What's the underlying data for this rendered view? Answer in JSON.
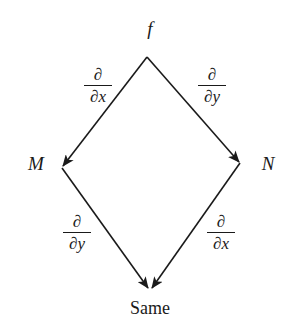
{
  "diagram": {
    "type": "commutative-diagram",
    "nodes": {
      "top": {
        "label": "f"
      },
      "left": {
        "label": "M"
      },
      "right": {
        "label": "N"
      },
      "bottom": {
        "label": "Same"
      }
    },
    "edges": [
      {
        "from": "f",
        "to": "M",
        "numerator": "∂",
        "denominator": "∂x"
      },
      {
        "from": "f",
        "to": "N",
        "numerator": "∂",
        "denominator": "∂y"
      },
      {
        "from": "M",
        "to": "Same",
        "numerator": "∂",
        "denominator": "∂y"
      },
      {
        "from": "N",
        "to": "Same",
        "numerator": "∂",
        "denominator": "∂x"
      }
    ],
    "colors": {
      "line": "#1a1a1a",
      "background": "#ffffff"
    }
  }
}
